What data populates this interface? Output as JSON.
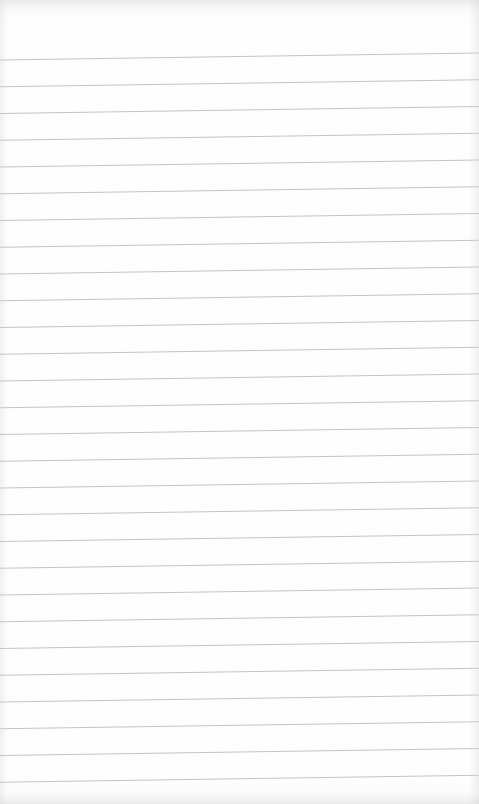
{
  "paper": {
    "type": "lined-paper",
    "background_color": "#fefefe",
    "line_color": "#c4c4c4",
    "line_count": 28,
    "first_line_left_y": 60,
    "first_line_right_y": 53,
    "line_spacing": 26.75
  }
}
